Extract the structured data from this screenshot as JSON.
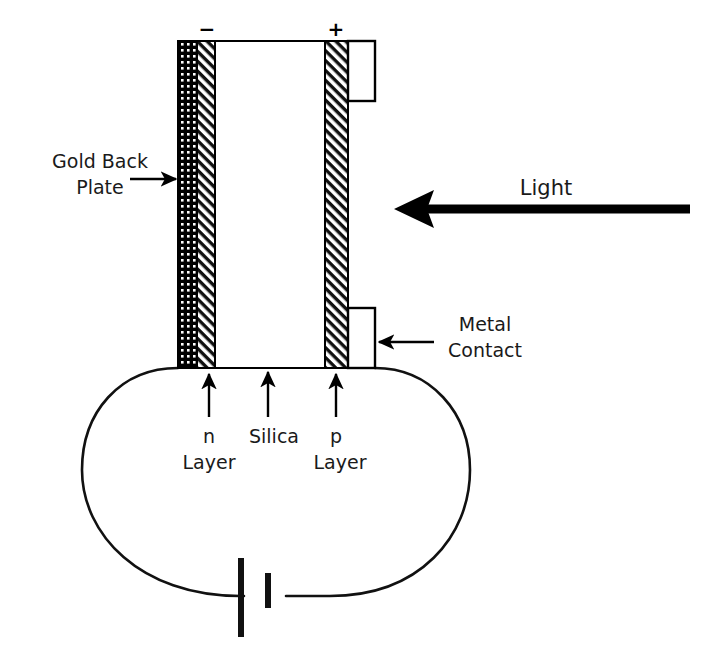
{
  "figure": {
    "kind": "cross-section-schematic",
    "background_color": "#ffffff",
    "line_color": "#000000",
    "text_color": "#1a1a1a",
    "width": 709,
    "height": 649
  },
  "polarity": {
    "negative_sign": "−",
    "positive_sign": "+"
  },
  "labels": {
    "gold_back_plate_line1": "Gold Back",
    "gold_back_plate_line2": "Plate",
    "light": "Light",
    "metal_contact_line1": "Metal",
    "metal_contact_line2": "Contact",
    "n_layer_line1": "n",
    "n_layer_line2": "Layer",
    "silica": "Silica",
    "p_layer_line1": "p",
    "p_layer_line2": "Layer"
  },
  "layers": [
    {
      "name": "gold-back-plate",
      "fill_pattern": "stipple-dots",
      "x": 178,
      "width": 19
    },
    {
      "name": "n-layer",
      "fill_pattern": "diagonal-hatch",
      "x": 197,
      "width": 18
    },
    {
      "name": "silica",
      "fill_pattern": "none",
      "x": 215,
      "width": 110
    },
    {
      "name": "p-layer",
      "fill_pattern": "diagonal-hatch",
      "x": 325,
      "width": 23
    }
  ],
  "stack": {
    "top": 41,
    "bottom": 368
  },
  "metal_contacts": [
    {
      "name": "upper-metal-contact",
      "x": 348,
      "y": 41,
      "width": 27,
      "height": 60
    },
    {
      "name": "lower-metal-contact",
      "x": 348,
      "y": 308,
      "width": 27,
      "height": 60
    }
  ],
  "circuit": {
    "loop_shape": "ellipse",
    "battery_symbol": "cell",
    "battery_long_plate_side": "left",
    "battery_short_plate_side": "right"
  },
  "annotations": [
    {
      "name": "gold-back-plate-arrow",
      "direction": "right",
      "style": "thin"
    },
    {
      "name": "light-arrow",
      "direction": "left",
      "style": "thick"
    },
    {
      "name": "metal-contact-arrow",
      "direction": "left",
      "style": "thin"
    },
    {
      "name": "n-layer-arrow",
      "direction": "up",
      "style": "thin"
    },
    {
      "name": "silica-arrow",
      "direction": "up",
      "style": "thin"
    },
    {
      "name": "p-layer-arrow",
      "direction": "up",
      "style": "thin"
    }
  ]
}
